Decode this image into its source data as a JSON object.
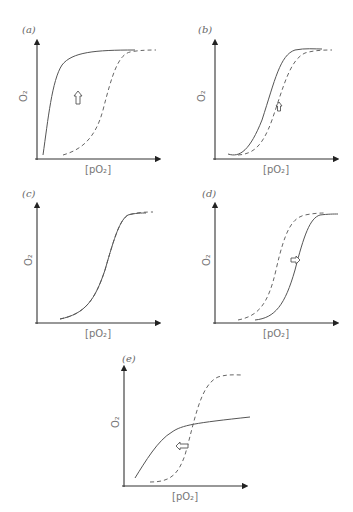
{
  "figure": {
    "panels": [
      {
        "id": "a",
        "label": "(a)",
        "ylabel": "O2",
        "xlabel": "[pO2]",
        "shift": "up/left"
      },
      {
        "id": "b",
        "label": "(b)",
        "ylabel": "O2",
        "xlabel": "[pO2]",
        "shift": "left (small)"
      },
      {
        "id": "c",
        "label": "(c)",
        "ylabel": "O2",
        "xlabel": "[pO2]",
        "shift": "none"
      },
      {
        "id": "d",
        "label": "(d)",
        "ylabel": "O2",
        "xlabel": "[pO2]",
        "shift": "right"
      },
      {
        "id": "e",
        "label": "(e)",
        "ylabel": "O2",
        "xlabel": "[pO2]",
        "shift": "left"
      }
    ],
    "legend": {
      "solid": "altered curve",
      "dashed": "reference curve"
    }
  }
}
